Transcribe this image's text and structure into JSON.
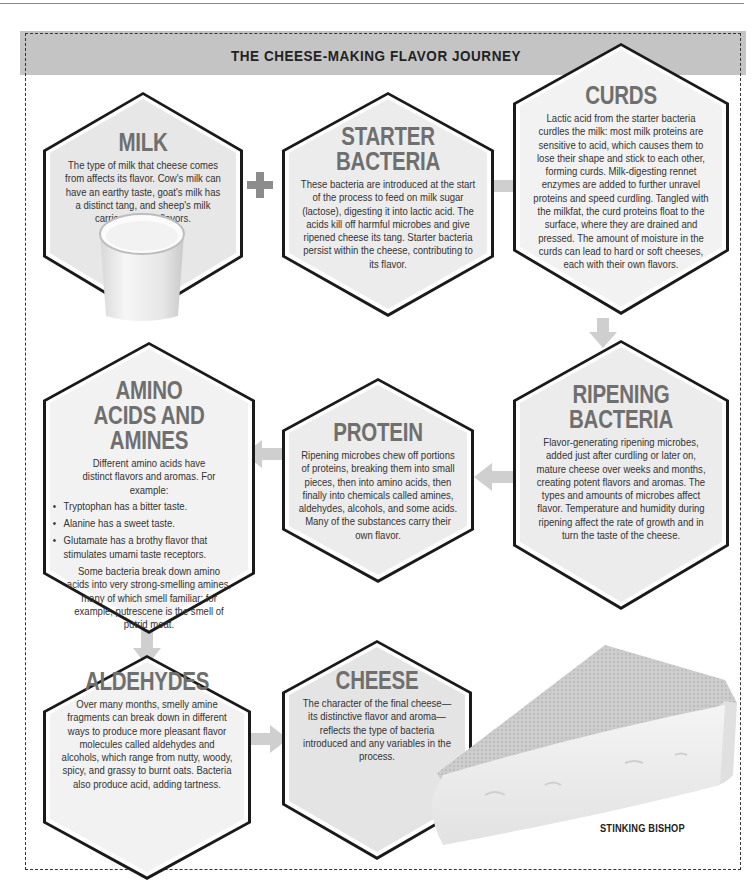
{
  "page": {
    "title": "THE CHEESE-MAKING FLAVOR JOURNEY"
  },
  "stages": {
    "milk": {
      "title": "MILK",
      "text": "The type of milk that cheese comes from affects its flavor. Cow's milk can have an earthy taste, goat's milk has a distinct tang, and sheep's milk carries creamy flavors."
    },
    "starter": {
      "title_line1": "STARTER",
      "title_line2": "BACTERIA",
      "text": "These bacteria are introduced at the start of the process to feed on milk sugar (lactose), digesting it into lactic acid. The acids kill off harmful microbes and give ripened cheese its tang. Starter bacteria persist within the cheese, contributing to its flavor."
    },
    "curds": {
      "title": "CURDS",
      "text": "Lactic acid from the starter bacteria curdles the milk: most milk proteins are sensitive to acid, which causes them to lose their shape and stick to each other, forming curds. Milk-digesting rennet enzymes are added to further unravel proteins and speed curdling. Tangled with the milkfat, the curd proteins float to the surface, where they are drained and pressed. The amount of moisture in the curds can lead to hard or soft cheeses, each with their own flavors."
    },
    "ripening": {
      "title_line1": "RIPENING",
      "title_line2": "BACTERIA",
      "text": "Flavor-generating ripening microbes, added just after curdling or later on, mature cheese over weeks and months, creating potent flavors and aromas. The types and amounts of microbes affect flavor. Temperature and humidity during ripening affect the rate of growth and in turn the taste of the cheese."
    },
    "protein": {
      "title": "PROTEIN",
      "text": "Ripening microbes chew off portions of proteins, breaking them into small pieces, then into amino acids, then finally into chemicals called amines, aldehydes, alcohols, and some acids. Many of the substances carry their own flavor."
    },
    "amino": {
      "title_line1": "AMINO",
      "title_line2": "ACIDS AND AMINES",
      "intro": "Different amino acids have distinct flavors and aromas. For example:",
      "bullets": [
        "Tryptophan has a bitter taste.",
        "Alanine has a sweet taste.",
        "Glutamate has a brothy flavor that stimulates umami taste receptors."
      ],
      "outro": "Some bacteria break down amino acids into very strong-smelling amines, many of which smell familiar; for example, putrescene is the smell of putrid meat."
    },
    "aldehydes": {
      "title": "ALDEHYDES",
      "text": "Over many months, smelly amine fragments can break down in different ways to produce more pleasant flavor molecules called aldehydes and alcohols, which range from nutty, woody, spicy, and grassy to burnt oats. Bacteria also produce acid, adding tartness."
    },
    "cheese": {
      "title": "CHEESE",
      "text": "The character of the final cheese—its distinctive flavor and aroma—reflects the type of bacteria introduced and any variables in the process."
    }
  },
  "images": {
    "milk_glass": "glass-of-milk",
    "cheese_wedge": "cheese-wedge",
    "cheese_caption": "STINKING BISHOP"
  },
  "connectors": {
    "plus_symbol": "+",
    "arrows": [
      "starter-to-curds",
      "curds-to-ripening",
      "ripening-to-protein",
      "protein-to-amino",
      "amino-to-aldehydes",
      "aldehydes-to-cheese"
    ]
  },
  "colors": {
    "banner": "#c4c4c4",
    "hex_fill": "#ebebeb",
    "hex_fill_light": "#f3f3f3",
    "hex_stroke": "#1a1a1a",
    "title_gray": "#6f6f6f",
    "arrow_gray": "#c9c9c9",
    "plus_gray": "#8c8c8c"
  }
}
